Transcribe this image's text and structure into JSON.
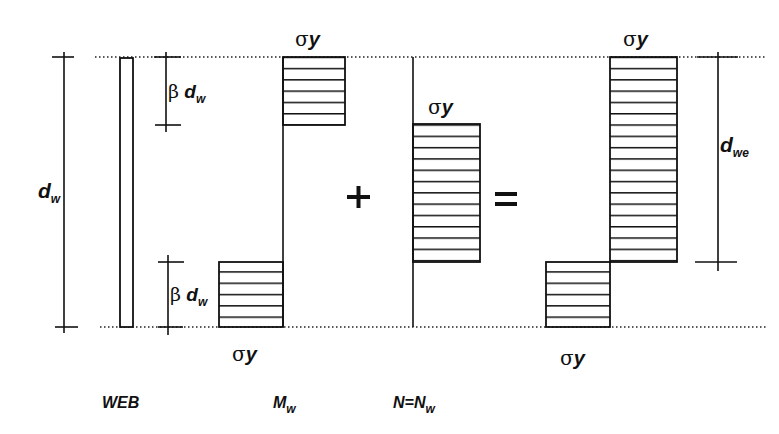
{
  "diagram": {
    "colors": {
      "line": "#111111",
      "background": "#ffffff"
    },
    "labels": {
      "sigma_symbol": "σ",
      "y_symbol": "y",
      "beta_symbol": "β",
      "d_symbol": "d",
      "w_sub": "w",
      "we_sub": "we",
      "plus": "+",
      "equals": "="
    },
    "captions": {
      "web": "WEB",
      "moment_main": "M",
      "moment_sub": "w",
      "axial_main": "N=N",
      "axial_sub": "w"
    },
    "panels": [
      {
        "name": "web",
        "caption": "WEB",
        "dimension": "d_w"
      },
      {
        "name": "bending",
        "caption": "M_w",
        "upper_block": "βd_w",
        "lower_block": "βd_w",
        "stress_top": "σy",
        "stress_bottom": "σy"
      },
      {
        "name": "axial",
        "caption": "N=N_w",
        "stress": "σy"
      },
      {
        "name": "combined",
        "stress_top": "σy",
        "stress_bottom": "σy",
        "dimension": "d_we"
      }
    ]
  }
}
